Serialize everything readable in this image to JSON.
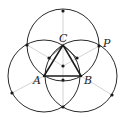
{
  "figure": {
    "colors": {
      "stroke": "#2a2a2a",
      "ray": "#c8c8c8",
      "dot": "#1a1a1a",
      "background": "#ffffff"
    },
    "labels": {
      "A": "A",
      "B": "B",
      "C": "C",
      "P": "P"
    },
    "points": {
      "A": [
        44,
        76
      ],
      "B": [
        81,
        76
      ],
      "C": [
        63,
        45
      ],
      "P": [
        99,
        46
      ],
      "top": [
        63,
        11
      ],
      "bottom": [
        63,
        107
      ],
      "left_upper": [
        27,
        45
      ],
      "left_lower": [
        12,
        93
      ],
      "right_lower": [
        112,
        95
      ],
      "centroid": [
        63,
        66
      ],
      "mid_AB": [
        63,
        80
      ],
      "mid_AC": [
        49,
        58
      ],
      "mid_BC": [
        77,
        58
      ]
    },
    "circles": [
      {
        "name": "circle-C",
        "cx": 63,
        "cy": 45,
        "r": 36
      },
      {
        "name": "circle-A",
        "cx": 44,
        "cy": 76,
        "r": 36
      },
      {
        "name": "circle-B",
        "cx": 81,
        "cy": 76,
        "r": 36
      }
    ]
  }
}
